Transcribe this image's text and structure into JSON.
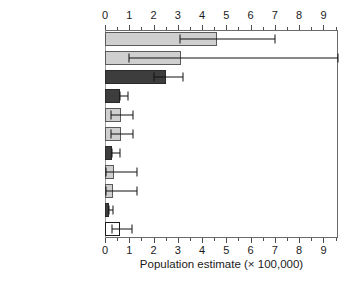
{
  "chart_data": {
    "type": "bar",
    "orientation": "horizontal",
    "title": "",
    "xlabel": "Population estimate (× 100,000)",
    "ylabel": "",
    "xlim": [
      0,
      9.6
    ],
    "xticks": [
      0,
      1,
      2,
      3,
      4,
      5,
      6,
      7,
      8,
      9
    ],
    "xtick_labels": [
      "0",
      "1",
      "2",
      "3",
      "4",
      "5",
      "6",
      "7",
      "8",
      "9"
    ],
    "minor_tick_step": 0.5,
    "grid": false,
    "legend": null,
    "axis_positions": [
      "top",
      "bottom"
    ],
    "categories": [
      "SPAIN",
      "FRANCE",
      "ITALY",
      "HUNGARY",
      "GREECE",
      "ROMANIA",
      "SLOVAKIA",
      "BULGARIA",
      "PORTUGAL",
      "UNITED KINGDOM",
      "Other countries"
    ],
    "values": [
      4.6,
      3.15,
      2.5,
      0.62,
      0.66,
      0.66,
      0.3,
      0.36,
      0.34,
      0.15,
      0.6
    ],
    "error_low": [
      3.1,
      1.0,
      2.0,
      0.6,
      0.25,
      0.25,
      0.3,
      0.05,
      0.05,
      0.15,
      0.3
    ],
    "error_high": [
      7.0,
      9.6,
      3.2,
      0.95,
      1.15,
      1.15,
      0.6,
      1.3,
      1.3,
      0.35,
      1.1
    ],
    "bar_styles": [
      "light",
      "light",
      "dark",
      "dark",
      "light",
      "light",
      "dark",
      "light",
      "light",
      "dark",
      "white"
    ],
    "colors": {
      "light_fill": "#cfcfcf",
      "dark_fill": "#3d3d3d",
      "white_fill": "#ffffff",
      "outline": "#3a3a3a",
      "error_bar": "#111111",
      "axis": "#6b6b6b",
      "text": "#1a1a1a"
    }
  }
}
